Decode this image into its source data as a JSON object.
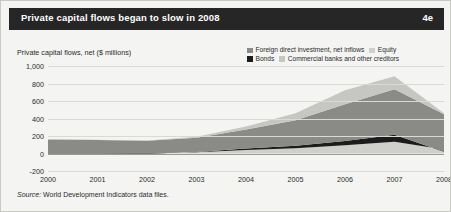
{
  "header": {
    "title": "Private capital flows began to slow in 2008",
    "figure_number": "4e",
    "bar_color": "#262626",
    "text_color": "#ffffff"
  },
  "source": {
    "prefix": "Source:",
    "text": "World Development Indicators data files."
  },
  "chart_data": {
    "type": "area",
    "stacked": true,
    "title": "Private capital flows began to slow in 2008",
    "axis_title": "Private capital flows, net ($ millions)",
    "xlabel": "",
    "ylabel": "Private capital flows, net ($ millions)",
    "grid": true,
    "legend_position": "top-right",
    "ylim": [
      -200,
      1000
    ],
    "yticks": [
      1000,
      800,
      600,
      400,
      200,
      0,
      -200
    ],
    "ytick_labels": [
      "1,000",
      "800",
      "600",
      "400",
      "200",
      "0",
      "-200"
    ],
    "categories": [
      "2000",
      "2001",
      "2002",
      "2003",
      "2004",
      "2005",
      "2006",
      "2007",
      "2008"
    ],
    "x": [
      2000,
      2001,
      2002,
      2003,
      2004,
      2005,
      2006,
      2007,
      2008
    ],
    "series": [
      {
        "name": "Equity",
        "color": "#cfcfcb",
        "stack_order": 1,
        "values": [
          12,
          8,
          6,
          14,
          40,
          60,
          95,
          135,
          45
        ]
      },
      {
        "name": "Bonds",
        "color": "#1c1c1c",
        "stack_order": 2,
        "values": [
          -18,
          -15,
          -10,
          2,
          18,
          30,
          48,
          78,
          -25
        ]
      },
      {
        "name": "Foreign direct investment, net inflows",
        "color": "#8a8a86",
        "stack_order": 3,
        "values": [
          165,
          160,
          150,
          165,
          215,
          290,
          420,
          520,
          430
        ]
      },
      {
        "name": "Commercial banks and other creditors",
        "color": "#c6c6c2",
        "stack_order": 4,
        "values": [
          8,
          5,
          4,
          10,
          35,
          80,
          160,
          150,
          10
        ]
      }
    ],
    "legend": [
      {
        "label": "Foreign direct investment, net inflows",
        "color": "#8a8a86"
      },
      {
        "label": "Equity",
        "color": "#cfcfcb"
      },
      {
        "label": "Bonds",
        "color": "#1c1c1c"
      },
      {
        "label": "Commercial banks and other creditors",
        "color": "#c6c6c2"
      }
    ]
  }
}
